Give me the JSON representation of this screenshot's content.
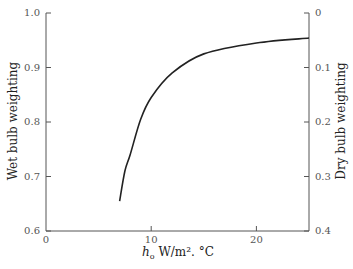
{
  "chart_data": {
    "type": "line",
    "title": "",
    "xlabel": "h_o W/m².°C",
    "xlabel_parts": {
      "symbol": "h",
      "subscript": "o",
      "unit": " W/m². °C"
    },
    "ylabel": "Wet bulb weighting",
    "y2label": "Dry bulb weighting",
    "xlim": [
      0,
      25
    ],
    "ylim": [
      0.6,
      1.0
    ],
    "y2lim": [
      0.4,
      0
    ],
    "x_ticks": [
      "0",
      "10",
      "20"
    ],
    "y_ticks": [
      "0.6",
      "0.7",
      "0.8",
      "0.9",
      "1.0"
    ],
    "y2_ticks": [
      "0.4",
      "0.3",
      "0.2",
      "0.1",
      "0"
    ],
    "grid": false,
    "legend": null,
    "series": [
      {
        "name": "weighting",
        "x": [
          7.0,
          7.5,
          8.0,
          9.0,
          10.0,
          12.0,
          15.0,
          20.0,
          25.0
        ],
        "values": [
          0.655,
          0.71,
          0.74,
          0.805,
          0.845,
          0.89,
          0.925,
          0.945,
          0.954
        ]
      }
    ]
  }
}
